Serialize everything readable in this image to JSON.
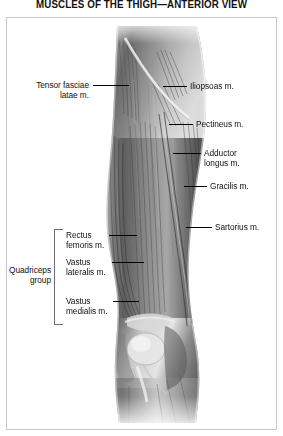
{
  "title": "MUSCLES OF THE THIGH—ANTERIOR VIEW",
  "illustration": {
    "name": "anterior-thigh-anatomy-illustration",
    "description": "Grayscale anatomical drawing of a right thigh, anterior view, showing superficial musculature from hip to knee",
    "style": "grayscale halftone airbrush rendering"
  },
  "labels": {
    "tensor_fasciae_latae": "Tensor fasciae\nlatae m.",
    "iliopsoas": "Iliopsoas m.",
    "pectineus": "Pectineus m.",
    "adductor_longus": "Adductor\nlongus m.",
    "gracilis": "Gracilis m.",
    "sartorius": "Sartorius m.",
    "rectus_femoris": "Rectus\nfemoris m.",
    "vastus_lateralis": "Vastus\nlateralis m.",
    "vastus_medialis": "Vastus\nmedialis m.",
    "quadriceps_group": "Quadriceps\ngroup"
  },
  "colors": {
    "text": "#111111",
    "frame_border": "#c8c8c8",
    "leader_line": "#000000",
    "bracket_line": "#6e6e6e",
    "background": "#ffffff",
    "art_dark": "#3a3a3a",
    "art_mid": "#8a8a8a",
    "art_light": "#d8d8d8"
  }
}
